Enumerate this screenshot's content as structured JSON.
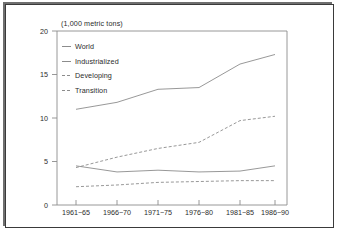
{
  "figure": {
    "background_color": "#ffffff",
    "frame_color": "#3a3a3a",
    "line_color": "#8c8c8c",
    "text_color": "#2b2b2b"
  },
  "chart_data": {
    "type": "line",
    "title": "(1,000 metric tons)",
    "xlabel": "",
    "ylabel": "",
    "ylim": [
      0,
      20
    ],
    "yticks": [
      0,
      5,
      10,
      15,
      20
    ],
    "ytick_labels": [
      "0",
      "5",
      "10",
      "15",
      "20"
    ],
    "categories": [
      "1961−65",
      "1966−70",
      "1971−75",
      "1976−80",
      "1981−85",
      "1986−90"
    ],
    "grid": false,
    "legend_position": "upper left",
    "series": [
      {
        "name": "World",
        "style": "solid",
        "values": [
          11.0,
          11.8,
          13.3,
          13.5,
          16.2,
          17.3
        ]
      },
      {
        "name": "Industrialized",
        "style": "solid",
        "values": [
          4.5,
          3.8,
          4.0,
          3.8,
          3.9,
          4.5
        ]
      },
      {
        "name": "Developing",
        "style": "dashed",
        "values": [
          4.3,
          5.5,
          6.5,
          7.2,
          9.7,
          10.2
        ]
      },
      {
        "name": "Transition",
        "style": "dashed",
        "values": [
          2.1,
          2.3,
          2.6,
          2.7,
          2.8,
          2.8
        ]
      }
    ]
  },
  "legend": {
    "entries": [
      {
        "label": "World",
        "style": "solid"
      },
      {
        "label": "Industrialized",
        "style": "solid"
      },
      {
        "label": "Developing",
        "style": "dashed"
      },
      {
        "label": "Transition",
        "style": "dashed"
      }
    ]
  }
}
